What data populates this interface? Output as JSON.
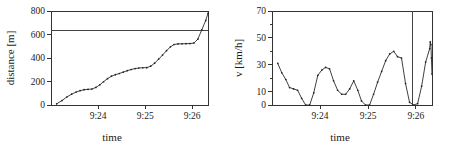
{
  "figure": {
    "panels": [
      {
        "id": "distance-panel",
        "name": "distance-vs-time-chart",
        "chart_index": 0
      },
      {
        "id": "velocity-panel",
        "name": "velocity-vs-time-chart",
        "chart_index": 1
      }
    ],
    "colors": {
      "axis": "#333333",
      "data": "#2b2b2b",
      "reference_line": "#444444",
      "background": "#ffffff"
    }
  },
  "chart_data": [
    {
      "type": "line",
      "title": "",
      "xlabel": "time",
      "ylabel": "distance [m]",
      "xlim": [
        9.3833,
        9.4389
      ],
      "ylim": [
        0,
        800
      ],
      "grid": false,
      "legend": null,
      "xticks": [
        9.4,
        9.4167,
        9.4333
      ],
      "xticklabels": [
        "9:24",
        "9:25",
        "9:26"
      ],
      "yticks": [
        0,
        200,
        400,
        600,
        800
      ],
      "yticklabels": [
        "0",
        "200",
        "400",
        "600",
        "800"
      ],
      "annotations": [
        {
          "kind": "horizontal-reference-line",
          "y": 630,
          "label": ""
        }
      ],
      "x": [
        9.3853,
        9.3872,
        9.3889,
        9.3906,
        9.3922,
        9.3936,
        9.395,
        9.3964,
        9.3978,
        9.3992,
        9.4006,
        9.4019,
        9.4033,
        9.4047,
        9.4061,
        9.4075,
        9.4089,
        9.4103,
        9.4117,
        9.4131,
        9.4144,
        9.4158,
        9.4172,
        9.4186,
        9.42,
        9.4214,
        9.4228,
        9.4242,
        9.4256,
        9.4269,
        9.4283,
        9.4297,
        9.4311,
        9.4325,
        9.4339,
        9.4353,
        9.4367,
        9.4381
      ],
      "y": [
        10,
        38,
        68,
        92,
        110,
        122,
        130,
        133,
        136,
        150,
        172,
        198,
        224,
        245,
        258,
        268,
        280,
        292,
        302,
        310,
        315,
        317,
        318,
        330,
        356,
        390,
        425,
        462,
        495,
        515,
        520,
        521,
        522,
        523,
        527,
        560,
        640,
        720
      ],
      "y_end": 780,
      "markers": true
    },
    {
      "type": "line",
      "title": "",
      "xlabel": "time",
      "ylabel": "v [km/h]",
      "xlim": [
        9.3833,
        9.4389
      ],
      "ylim": [
        0,
        70
      ],
      "grid": false,
      "legend": null,
      "xticks": [
        9.4,
        9.4167,
        9.4333
      ],
      "xticklabels": [
        "9:24",
        "9:25",
        "9:26"
      ],
      "yticks": [
        0,
        10,
        20,
        30,
        40,
        50,
        60,
        70
      ],
      "yticklabels": [
        "0",
        "10",
        "",
        "30",
        "",
        "50",
        "",
        "70"
      ],
      "minor_yticks": [
        20,
        40,
        60
      ],
      "annotations": [
        {
          "kind": "vertical-reference-line",
          "x": 9.4322,
          "label": ""
        }
      ],
      "x": [
        9.3853,
        9.3867,
        9.3881,
        9.3894,
        9.3908,
        9.3922,
        9.3936,
        9.395,
        9.3964,
        9.3978,
        9.3992,
        9.4006,
        9.4019,
        9.4033,
        9.4047,
        9.4061,
        9.4075,
        9.4089,
        9.4103,
        9.4117,
        9.4131,
        9.4144,
        9.4158,
        9.4172,
        9.4186,
        9.42,
        9.4214,
        9.4228,
        9.4242,
        9.4256,
        9.4269,
        9.4283,
        9.4297,
        9.4311,
        9.4325,
        9.4339,
        9.4353,
        9.4367,
        9.4381
      ],
      "y": [
        31,
        24,
        19,
        13,
        12,
        11,
        5,
        0,
        0,
        9,
        22,
        26,
        28,
        27,
        18,
        11,
        8,
        8,
        12,
        18,
        11,
        3,
        0,
        0,
        8,
        17,
        25,
        33,
        38,
        40,
        36,
        35,
        16,
        2,
        0,
        1,
        14,
        32,
        42
      ],
      "y_end_values": [
        47,
        45,
        35,
        23
      ],
      "markers": true
    }
  ],
  "labels": {
    "left_ylabel": "distance [m]",
    "left_xlabel": "time",
    "right_ylabel": "v [km/h]",
    "right_xlabel": "time"
  }
}
